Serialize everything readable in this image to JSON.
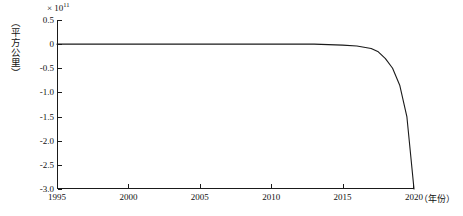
{
  "chart_data": {
    "type": "line",
    "title": "",
    "subtitle": "",
    "xlabel": "（年份）",
    "ylabel": "（平方公里）",
    "y_multiplier": "× 10",
    "y_multiplier_exponent": "11",
    "x": [
      1995,
      1996,
      1997,
      1998,
      1999,
      2000,
      2001,
      2002,
      2003,
      2004,
      2005,
      2006,
      2007,
      2008,
      2009,
      2010,
      2011,
      2012,
      2013,
      2014,
      2015,
      2016,
      2017,
      2017.5,
      2018,
      2018.5,
      2019,
      2019.5,
      2020
    ],
    "values": [
      0.0,
      0.0,
      0.0,
      0.0,
      0.0,
      0.0,
      0.0,
      0.0,
      0.0,
      0.0,
      0.0,
      0.0,
      0.0,
      0.0,
      0.0,
      0.0,
      0.0,
      0.0,
      0.0,
      -0.01,
      -0.02,
      -0.04,
      -0.09,
      -0.16,
      -0.3,
      -0.5,
      -0.85,
      -1.5,
      -3.0
    ],
    "series": [
      {
        "name": "",
        "values": [
          0.0,
          0.0,
          0.0,
          0.0,
          0.0,
          0.0,
          0.0,
          0.0,
          0.0,
          0.0,
          0.0,
          0.0,
          0.0,
          0.0,
          0.0,
          0.0,
          0.0,
          0.0,
          0.0,
          -0.01,
          -0.02,
          -0.04,
          -0.09,
          -0.16,
          -0.3,
          -0.5,
          -0.85,
          -1.5,
          -3.0
        ],
        "color": "#1a1a1a"
      }
    ],
    "xlim": [
      1995,
      2020
    ],
    "ylim": [
      -3.0,
      0.5
    ],
    "xticks": [
      1995,
      2000,
      2005,
      2010,
      2015,
      2020
    ],
    "xtick_labels": [
      "1995",
      "2000",
      "2005",
      "2010",
      "2015",
      "2020"
    ],
    "yticks": [
      0.5,
      0.0,
      -0.5,
      -1.0,
      -1.5,
      -2.0,
      -2.5,
      -3.0
    ],
    "ytick_labels": [
      "0.5",
      "0",
      "-0.5",
      "-1.0",
      "-1.5",
      "-2.0",
      "-2.5",
      "-3.0"
    ],
    "grid": false,
    "legend": false,
    "legend_position": "none",
    "line_color": "#1a1a1a",
    "axis_color": "#1a1a1a",
    "background_color": "#ffffff"
  }
}
